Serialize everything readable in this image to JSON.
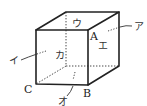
{
  "diagram": {
    "type": "cube",
    "vertices": {
      "A": "A",
      "B": "B",
      "C": "C"
    },
    "faces": {
      "top": "ウ",
      "front": "カ",
      "right": "エ",
      "back_leader": "ア",
      "left_leader": "イ",
      "bottom_leader": "オ"
    },
    "colors": {
      "line": "#222222",
      "background": "#ffffff"
    }
  }
}
